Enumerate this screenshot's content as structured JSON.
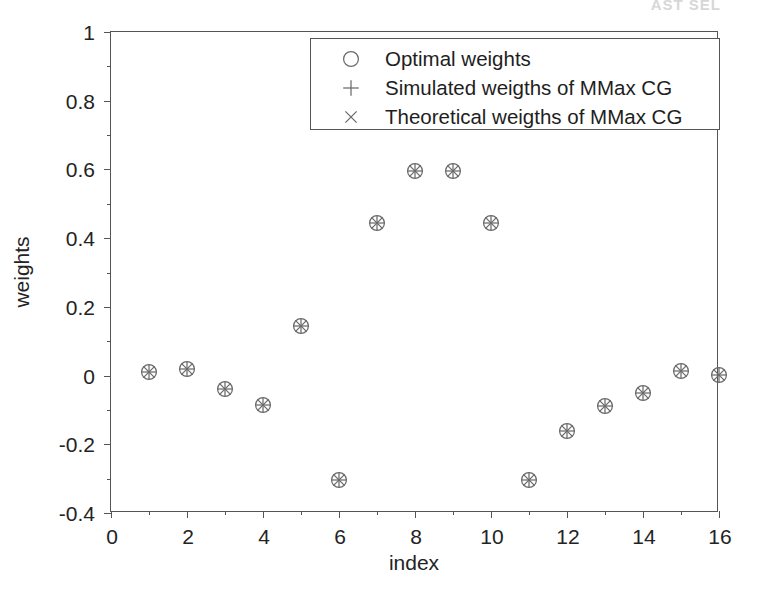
{
  "figure": {
    "background": "#ffffff",
    "axis_color": "#555555",
    "text_color": "#232323",
    "marker_color": "#6a6a6a",
    "scan_artifact_text": "AST SEL"
  },
  "chart_data": {
    "type": "scatter",
    "title": "",
    "xlabel": "index",
    "ylabel": "weights",
    "xlim": [
      0,
      16
    ],
    "ylim": [
      -0.4,
      1
    ],
    "xticks": [
      0,
      2,
      4,
      6,
      8,
      10,
      12,
      14,
      16
    ],
    "xtick_labels": [
      "0",
      "2",
      "4",
      "6",
      "8",
      "10",
      "12",
      "14",
      "16"
    ],
    "xticks_minor": [
      1,
      3,
      5,
      7,
      9,
      11,
      13,
      15
    ],
    "yticks": [
      -0.4,
      -0.2,
      0,
      0.2,
      0.4,
      0.6,
      0.8,
      1
    ],
    "ytick_labels": [
      "-0.4",
      "-0.2",
      "0",
      "0.2",
      "0.4",
      "0.6",
      "0.8",
      "1"
    ],
    "grid": false,
    "legend_position": "upper center",
    "x": [
      1,
      2,
      3,
      4,
      5,
      6,
      7,
      8,
      9,
      10,
      11,
      12,
      13,
      14,
      15,
      16
    ],
    "series": [
      {
        "name": "Optimal weights",
        "marker": "circle",
        "marker_glyph": "o",
        "values": [
          0.01,
          0.02,
          -0.04,
          -0.085,
          0.145,
          -0.305,
          0.445,
          0.595,
          0.595,
          0.445,
          -0.305,
          -0.16,
          -0.09,
          -0.05,
          0.012,
          0.003
        ]
      },
      {
        "name": "Simulated weigths of MMax CG",
        "marker": "plus",
        "marker_glyph": "+",
        "values": [
          0.01,
          0.02,
          -0.04,
          -0.085,
          0.145,
          -0.305,
          0.445,
          0.595,
          0.595,
          0.445,
          -0.305,
          -0.16,
          -0.09,
          -0.05,
          0.012,
          0.003
        ]
      },
      {
        "name": "Theoretical weigths of MMax CG",
        "marker": "cross",
        "marker_glyph": "x",
        "values": [
          0.01,
          0.02,
          -0.04,
          -0.085,
          0.145,
          -0.305,
          0.445,
          0.595,
          0.595,
          0.445,
          -0.305,
          -0.16,
          -0.09,
          -0.05,
          0.012,
          0.003
        ]
      }
    ]
  },
  "legend": {
    "entries": [
      {
        "symbol": "o",
        "label": "Optimal weights"
      },
      {
        "symbol": "+",
        "label": "Simulated weigths of MMax CG"
      },
      {
        "symbol": "x",
        "label": "Theoretical weigths of MMax CG"
      }
    ]
  }
}
